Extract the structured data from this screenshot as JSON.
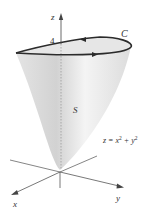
{
  "figure": {
    "labels": {
      "z_axis": "z",
      "x_axis": "x",
      "y_axis": "y",
      "height_tick": "4",
      "curve": "C",
      "surface": "S",
      "equation_lhs": "z = x",
      "equation_exp1": "2",
      "equation_mid": " + y",
      "equation_exp2": "2"
    },
    "colors": {
      "surface_fill": "#d9d9d9",
      "surface_light": "#f2f2f2",
      "rim_curve": "#2b2b2b",
      "axes": "#555555"
    }
  }
}
